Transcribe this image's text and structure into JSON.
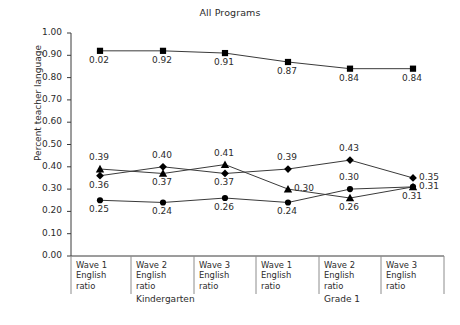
{
  "figure": {
    "title": "All Programs",
    "y_axis_title": "Percent teacher language",
    "background_color": "#ffffff",
    "line_color": "#3a3a3a",
    "marker_color": "#000000",
    "text_color": "#2b2b2b"
  },
  "chart_data": {
    "type": "line",
    "title": "All Programs",
    "xlabel": "",
    "ylabel": "Percent teacher language",
    "ylim": [
      0.0,
      1.0
    ],
    "ytick_labels": [
      "1.00",
      "0.90",
      "0.80",
      "0.70",
      "0.60",
      "0.50",
      "0.40",
      "0.30",
      "0.20",
      "0.10",
      "0.00"
    ],
    "ytick_values": [
      1.0,
      0.9,
      0.8,
      0.7,
      0.6,
      0.5,
      0.4,
      0.3,
      0.2,
      0.1,
      0.0
    ],
    "grid": false,
    "legend": "none",
    "categories": [
      "Wave 1 English ratio",
      "Wave 2 English ratio",
      "Wave 3 English ratio",
      "Wave 1 English ratio",
      "Wave 2 English ratio",
      "Wave 3 English ratio"
    ],
    "category_lines": [
      [
        "Wave 1",
        "English",
        "ratio"
      ],
      [
        "Wave 2",
        "English",
        "ratio"
      ],
      [
        "Wave 3",
        "English",
        "ratio"
      ],
      [
        "Wave 1",
        "English",
        "ratio"
      ],
      [
        "Wave 2",
        "English",
        "ratio"
      ],
      [
        "Wave 3",
        "English",
        "ratio"
      ]
    ],
    "groups": [
      {
        "label": "Kindergarten",
        "categories": [
          0,
          1,
          2
        ]
      },
      {
        "label": "Grade 1",
        "categories": [
          3,
          4,
          5
        ]
      }
    ],
    "series": [
      {
        "name": "series-square",
        "marker": "square",
        "values": [
          0.92,
          0.92,
          0.91,
          0.87,
          0.84,
          0.84
        ],
        "data_labels": [
          "0.02",
          "0.92",
          "0.91",
          "0.87",
          "0.84",
          "0.84"
        ],
        "label_positions": [
          "below",
          "below",
          "below",
          "below",
          "below",
          "below"
        ]
      },
      {
        "name": "series-triangle",
        "marker": "triangle",
        "values": [
          0.39,
          0.37,
          0.41,
          0.3,
          0.26,
          0.31
        ],
        "data_labels": [
          "0.39",
          "0.37",
          "0.41",
          "0.30",
          "0.26",
          "0.31"
        ],
        "label_positions": [
          "above",
          "below",
          "above",
          "right",
          "below",
          "right"
        ]
      },
      {
        "name": "series-diamond",
        "marker": "diamond",
        "values": [
          0.36,
          0.4,
          0.37,
          0.39,
          0.43,
          0.35
        ],
        "data_labels": [
          "0.36",
          "0.40",
          "0.37",
          "0.39",
          "0.43",
          "0.35"
        ],
        "label_positions": [
          "below",
          "above",
          "below",
          "above",
          "above",
          "right"
        ]
      },
      {
        "name": "series-circle",
        "marker": "circle",
        "values": [
          0.25,
          0.24,
          0.26,
          0.24,
          0.3,
          0.31
        ],
        "data_labels": [
          "0.25",
          "0.24",
          "0.26",
          "0.24",
          "0.30",
          "0.31"
        ],
        "label_positions": [
          "below",
          "below",
          "below",
          "below",
          "above",
          "below"
        ]
      }
    ]
  }
}
